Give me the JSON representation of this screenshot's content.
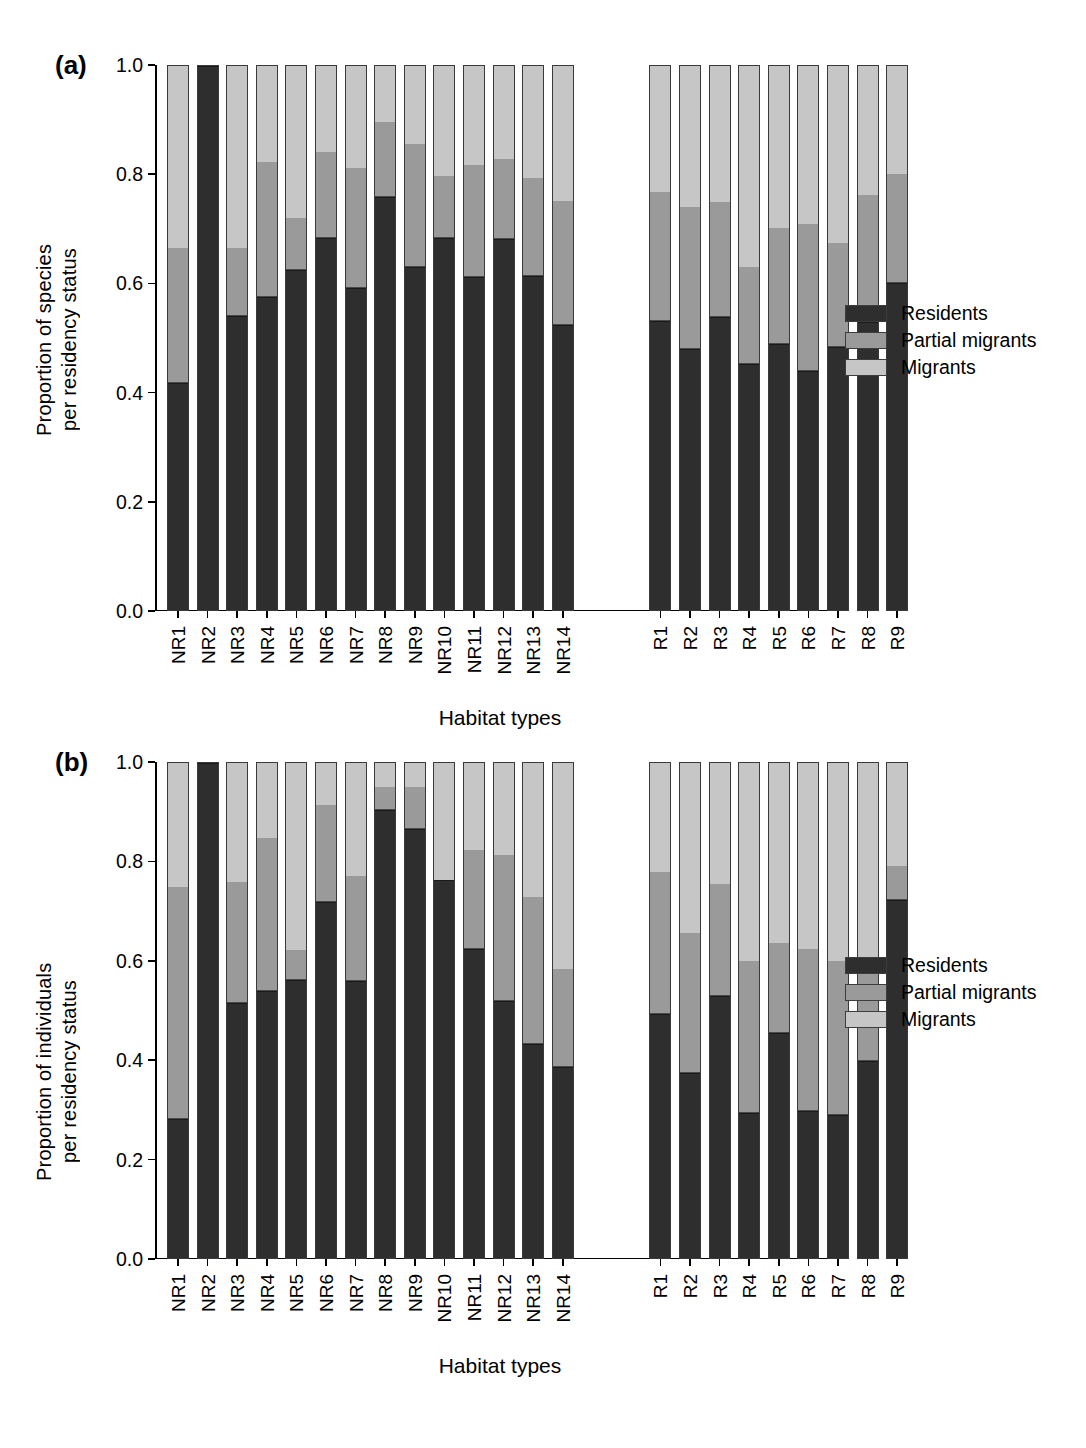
{
  "figure": {
    "panels": [
      {
        "letter": "(a)",
        "ylabel": "Proportion of species\nper residency status",
        "xlabel": "Habitat types"
      },
      {
        "letter": "(b)",
        "ylabel": "Proportion of individuals\nper residency status",
        "xlabel": "Habitat types"
      }
    ],
    "legend": {
      "position": "right",
      "entries": [
        {
          "label": "Residents",
          "color": "#2e2e2e"
        },
        {
          "label": "Partial migrants",
          "color": "#9a9a9a"
        },
        {
          "label": "Migrants",
          "color": "#c6c6c6"
        }
      ]
    },
    "ytick_labels": [
      "0.0",
      "0.2",
      "0.4",
      "0.6",
      "0.8",
      "1.0"
    ]
  },
  "chart_data": [
    {
      "type": "bar",
      "subtype": "stacked-100-percent",
      "panel": "(a)",
      "title": "",
      "xlabel": "Habitat types",
      "ylabel": "Proportion of species per residency status",
      "ylim": [
        0.0,
        1.0
      ],
      "yticks": [
        0.0,
        0.2,
        0.4,
        0.6,
        0.8,
        1.0
      ],
      "grid": false,
      "groups": [
        "NR",
        "R"
      ],
      "categories": [
        "NR1",
        "NR2",
        "NR3",
        "NR4",
        "NR5",
        "NR6",
        "NR7",
        "NR8",
        "NR9",
        "NR10",
        "NR11",
        "NR12",
        "NR13",
        "NR14",
        "R1",
        "R2",
        "R3",
        "R4",
        "R5",
        "R6",
        "R7",
        "R8",
        "R9"
      ],
      "series": [
        {
          "name": "Residents",
          "values": [
            0.417,
            1.0,
            0.541,
            0.575,
            0.625,
            0.683,
            0.592,
            0.759,
            0.631,
            0.684,
            0.613,
            0.682,
            0.614,
            0.524,
            0.532,
            0.479,
            0.538,
            0.452,
            0.489,
            0.44,
            0.484,
            0.529,
            0.602
          ]
        },
        {
          "name": "Partial migrants",
          "values": [
            0.249,
            0.0,
            0.125,
            0.248,
            0.095,
            0.159,
            0.221,
            0.139,
            0.226,
            0.114,
            0.205,
            0.148,
            0.181,
            0.228,
            0.236,
            0.262,
            0.212,
            0.178,
            0.214,
            0.27,
            0.19,
            0.234,
            0.2
          ]
        },
        {
          "name": "Migrants",
          "values": [
            0.334,
            0.0,
            0.334,
            0.177,
            0.28,
            0.158,
            0.187,
            0.102,
            0.143,
            0.202,
            0.182,
            0.17,
            0.205,
            0.248,
            0.232,
            0.259,
            0.25,
            0.37,
            0.297,
            0.29,
            0.326,
            0.237,
            0.198
          ]
        }
      ],
      "stack_tops": {
        "residents": [
          0.417,
          1.0,
          0.541,
          0.575,
          0.625,
          0.683,
          0.592,
          0.759,
          0.631,
          0.684,
          0.613,
          0.682,
          0.614,
          0.524,
          0.532,
          0.479,
          0.538,
          0.452,
          0.489,
          0.44,
          0.484,
          0.529,
          0.602
        ],
        "residents_plus_partial": [
          0.666,
          1.0,
          0.666,
          0.823,
          0.72,
          0.842,
          0.813,
          0.898,
          0.857,
          0.798,
          0.818,
          0.83,
          0.795,
          0.752,
          0.768,
          0.741,
          0.75,
          0.63,
          0.703,
          0.71,
          0.674,
          0.763,
          0.802
        ]
      }
    },
    {
      "type": "bar",
      "subtype": "stacked-100-percent",
      "panel": "(b)",
      "title": "",
      "xlabel": "Habitat types",
      "ylabel": "Proportion of individuals per residency status",
      "ylim": [
        0.0,
        1.0
      ],
      "yticks": [
        0.0,
        0.2,
        0.4,
        0.6,
        0.8,
        1.0
      ],
      "grid": false,
      "groups": [
        "NR",
        "R"
      ],
      "categories": [
        "NR1",
        "NR2",
        "NR3",
        "NR4",
        "NR5",
        "NR6",
        "NR7",
        "NR8",
        "NR9",
        "NR10",
        "NR11",
        "NR12",
        "NR13",
        "NR14",
        "R1",
        "R2",
        "R3",
        "R4",
        "R5",
        "R6",
        "R7",
        "R8",
        "R9"
      ],
      "series": [
        {
          "name": "Residents",
          "values": [
            0.281,
            1.0,
            0.515,
            0.539,
            0.561,
            0.719,
            0.56,
            0.906,
            0.866,
            0.763,
            0.625,
            0.519,
            0.432,
            0.385,
            0.493,
            0.373,
            0.53,
            0.293,
            0.455,
            0.297,
            0.289,
            0.399,
            0.723
          ]
        },
        {
          "name": "Partial migrants",
          "values": [
            0.468,
            0.0,
            0.245,
            0.31,
            0.061,
            0.196,
            0.211,
            0.045,
            0.085,
            0.0,
            0.199,
            0.296,
            0.298,
            0.198,
            0.287,
            0.283,
            0.225,
            0.308,
            0.182,
            0.327,
            0.311,
            0.197,
            0.068
          ]
        },
        {
          "name": "Migrants",
          "values": [
            0.251,
            0.0,
            0.24,
            0.151,
            0.378,
            0.085,
            0.229,
            0.049,
            0.049,
            0.237,
            0.176,
            0.185,
            0.27,
            0.417,
            0.22,
            0.344,
            0.245,
            0.399,
            0.363,
            0.376,
            0.4,
            0.404,
            0.209
          ]
        }
      ],
      "stack_tops": {
        "residents": [
          0.281,
          1.0,
          0.515,
          0.539,
          0.561,
          0.719,
          0.56,
          0.906,
          0.866,
          0.763,
          0.625,
          0.519,
          0.432,
          0.385,
          0.493,
          0.373,
          0.53,
          0.293,
          0.455,
          0.297,
          0.289,
          0.399,
          0.723
        ],
        "residents_plus_partial": [
          0.749,
          1.0,
          0.76,
          0.849,
          0.622,
          0.915,
          0.771,
          0.951,
          0.951,
          0.763,
          0.824,
          0.815,
          0.73,
          0.583,
          0.78,
          0.656,
          0.755,
          0.601,
          0.637,
          0.624,
          0.6,
          0.596,
          0.791
        ]
      }
    }
  ]
}
